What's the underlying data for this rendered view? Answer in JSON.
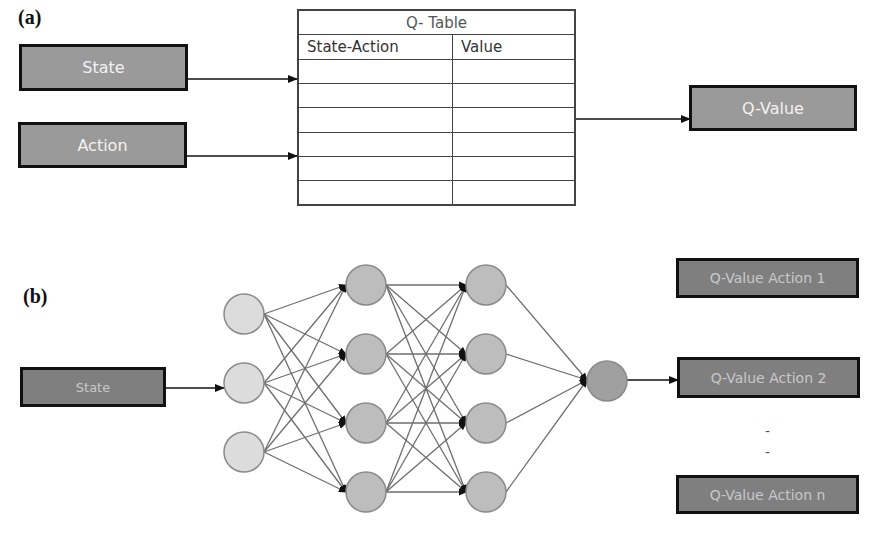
{
  "panel_a": {
    "label": "(a)",
    "inputs": [
      {
        "label": "State"
      },
      {
        "label": "Action"
      }
    ],
    "q_table": {
      "title": "Q- Table",
      "columns": [
        "State-Action",
        "Value"
      ],
      "rows": [
        [
          "",
          ""
        ],
        [
          "",
          ""
        ],
        [
          "",
          ""
        ],
        [
          "",
          ""
        ],
        [
          "",
          ""
        ],
        [
          "",
          ""
        ]
      ]
    },
    "output": {
      "label": "Q-Value"
    }
  },
  "panel_b": {
    "label": "(b)",
    "input": {
      "label": "State"
    },
    "network": {
      "layers": [
        {
          "name": "input",
          "neurons": 3,
          "color": "#dcdcdc"
        },
        {
          "name": "hidden-1",
          "neurons": 4,
          "color": "#bdbdbd"
        },
        {
          "name": "hidden-2",
          "neurons": 4,
          "color": "#bdbdbd"
        },
        {
          "name": "output",
          "neurons": 1,
          "color": "#9e9e9e"
        }
      ]
    },
    "outputs": [
      {
        "label": "Q-Value Action 1"
      },
      {
        "label": "Q-Value Action 2"
      },
      {
        "label": "Q-Value Action n"
      }
    ],
    "ellipsis": [
      "-",
      "-"
    ]
  },
  "colors": {
    "box_fill": "#9a9a9a",
    "box_fill_dark": "#7f7f7f",
    "box_border": "#111111",
    "edge": "#6e6e6e"
  }
}
